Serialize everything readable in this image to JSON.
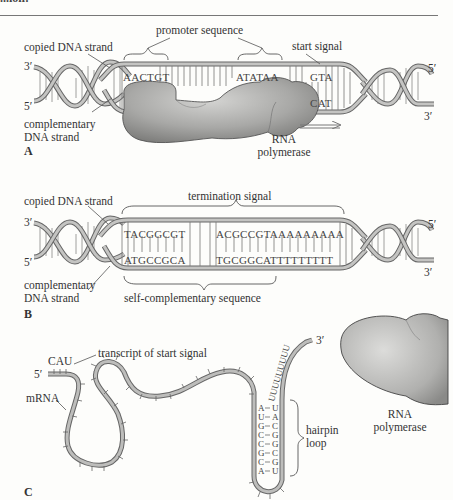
{
  "header": {
    "fragment": "...ion:"
  },
  "panel_a": {
    "label": "A",
    "copied_strand": "copied DNA strand",
    "complementary_strand_line1": "complementary",
    "complementary_strand_line2": "DNA strand",
    "promoter": "promoter sequence",
    "start_signal": "start signal",
    "seq_left": "AACTGT",
    "seq_mid": "ATATAA",
    "seq_start_top": "GTA",
    "seq_start_bottom": "CAT",
    "end_3_left": "3′",
    "end_5_left": "5′",
    "end_5_right": "5′",
    "end_3_right": "3′",
    "polymerase_line1": "RNA",
    "polymerase_line2": "polymerase"
  },
  "panel_b": {
    "label": "B",
    "copied_strand": "copied DNA strand",
    "complementary_strand_line1": "complementary",
    "complementary_strand_line2": "DNA strand",
    "termination": "termination signal",
    "self_complementary": "self-complementary sequence",
    "seq_top_left": "TACGGCGT",
    "seq_top_right": "ACGCCGTAAAAAAAAA",
    "seq_bottom_left": "ATGCCGCA",
    "seq_bottom_right": "TGCGGCATTTTTTTTT",
    "end_3_left": "3′",
    "end_5_left": "5′",
    "end_5_right": "5′",
    "end_3_right": "3′"
  },
  "panel_c": {
    "label": "C",
    "cau": "CAU",
    "transcript": "transcript of start signal",
    "mrna": "mRNA",
    "end_5": "5′",
    "end_3": "3′",
    "hairpin_line1": "hairpin",
    "hairpin_line2": "loop",
    "hairpin_left": [
      "A",
      "U",
      "G",
      "C",
      "C",
      "G",
      "C",
      "A"
    ],
    "hairpin_right": [
      "U",
      "A",
      "C",
      "G",
      "G",
      "C",
      "G",
      "U"
    ],
    "poly_u": "UUUUUUUUU",
    "polymerase_line1": "RNA",
    "polymerase_line2": "polymerase"
  },
  "colors": {
    "strand_fill": "#b8b8b6",
    "strand_edge": "#666666",
    "protein": "#a9a9a7",
    "background": "#fdfdfb"
  }
}
